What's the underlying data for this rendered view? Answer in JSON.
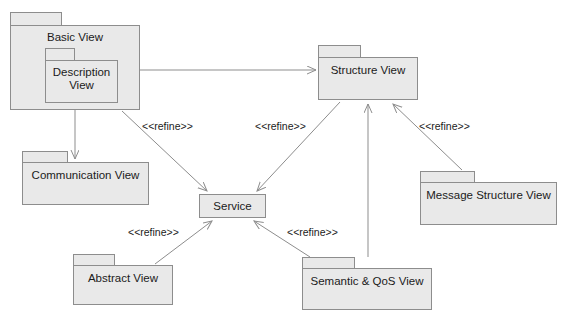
{
  "diagram": {
    "canvas": {
      "width": 569,
      "height": 326
    },
    "colors": {
      "background": "#ffffff",
      "package_fill": "#e9e9e9",
      "package_border": "#8d8d8d",
      "edge": "#8d8d8d",
      "text": "#1b1b1b"
    }
  },
  "packages": [
    {
      "id": "basic-view",
      "label": "Basic View",
      "tab": {
        "x": 10,
        "y": 12,
        "w": 52,
        "h": 13
      },
      "body": {
        "x": 10,
        "y": 25,
        "w": 130,
        "h": 85
      },
      "label_y": 31
    },
    {
      "id": "description-view",
      "label": "Description\nView",
      "tab": {
        "x": 45,
        "y": 48,
        "w": 30,
        "h": 12
      },
      "body": {
        "x": 45,
        "y": 60,
        "w": 73,
        "h": 43
      },
      "label_y": 66
    },
    {
      "id": "structure-view",
      "label": "Structure View",
      "tab": {
        "x": 318,
        "y": 45,
        "w": 43,
        "h": 12
      },
      "body": {
        "x": 318,
        "y": 57,
        "w": 100,
        "h": 43
      },
      "label_y": 64
    },
    {
      "id": "communication-view",
      "label": "Communication View",
      "tab": {
        "x": 22,
        "y": 151,
        "w": 46,
        "h": 11
      },
      "body": {
        "x": 22,
        "y": 162,
        "w": 127,
        "h": 43
      },
      "label_y": 169
    },
    {
      "id": "message-structure-view",
      "label": "Message Structure View",
      "tab": {
        "x": 420,
        "y": 171,
        "w": 55,
        "h": 11
      },
      "body": {
        "x": 420,
        "y": 182,
        "w": 137,
        "h": 43
      },
      "label_y": 189
    },
    {
      "id": "abstract-view",
      "label": "Abstract View",
      "tab": {
        "x": 73,
        "y": 254,
        "w": 42,
        "h": 11
      },
      "body": {
        "x": 73,
        "y": 265,
        "w": 100,
        "h": 40
      },
      "label_y": 272
    },
    {
      "id": "semantic-qos-view",
      "label": "Semantic & QoS View",
      "tab": {
        "x": 302,
        "y": 257,
        "w": 53,
        "h": 11
      },
      "body": {
        "x": 302,
        "y": 268,
        "w": 130,
        "h": 42
      },
      "label_y": 275
    }
  ],
  "plain_nodes": [
    {
      "id": "service",
      "label": "Service",
      "box": {
        "x": 199,
        "y": 194,
        "w": 67,
        "h": 24
      },
      "label_y": 200
    }
  ],
  "edges": [
    {
      "id": "basic-to-structure",
      "from": "basic-view",
      "to": "structure-view",
      "points": "140,70 316,70",
      "arrow": "open"
    },
    {
      "id": "basic-to-communication",
      "from": "basic-view",
      "to": "communication-view",
      "points": "75,110 75,159",
      "arrow": "open"
    },
    {
      "id": "basic-to-service",
      "from": "basic-view",
      "to": "service",
      "points": "122,111 207,191",
      "arrow": "open"
    },
    {
      "id": "structure-to-service",
      "from": "structure-view",
      "to": "service",
      "points": "340,102 257,191",
      "arrow": "open"
    },
    {
      "id": "semantic-to-structure",
      "from": "semantic-qos-view",
      "to": "structure-view",
      "points": "368,257 368,104",
      "arrow": "open"
    },
    {
      "id": "message-to-structure",
      "from": "message-structure-view",
      "to": "structure-view",
      "points": "462,170 393,104",
      "arrow": "open"
    },
    {
      "id": "abstract-to-service",
      "from": "abstract-view",
      "to": "service",
      "points": "155,264 212,221",
      "arrow": "open"
    },
    {
      "id": "semantic-to-service",
      "from": "semantic-qos-view",
      "to": "service",
      "points": "310,257 254,221",
      "arrow": "open"
    }
  ],
  "edge_labels": [
    {
      "id": "refine-basic-service",
      "text": "<<refine>>",
      "x": 142,
      "y": 120
    },
    {
      "id": "refine-structure-service",
      "text": "<<refine>>",
      "x": 255,
      "y": 120
    },
    {
      "id": "refine-message-structure",
      "text": "<<refine>>",
      "x": 419,
      "y": 120
    },
    {
      "id": "refine-abstract-service",
      "text": "<<refine>>",
      "x": 128,
      "y": 226
    },
    {
      "id": "refine-semantic-service",
      "text": "<<refine>>",
      "x": 287,
      "y": 226
    }
  ]
}
